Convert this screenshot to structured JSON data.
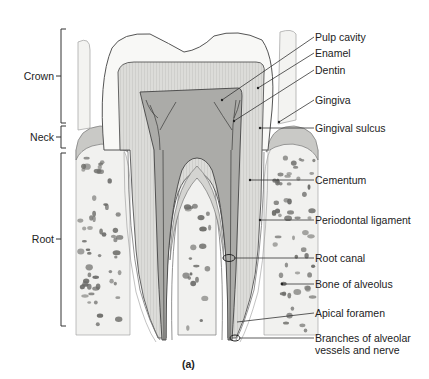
{
  "figure": {
    "caption": "(a)",
    "regions": [
      {
        "id": "crown",
        "label": "Crown"
      },
      {
        "id": "neck",
        "label": "Neck"
      },
      {
        "id": "root",
        "label": "Root"
      }
    ],
    "structures": [
      {
        "id": "pulp-cavity",
        "label": "Pulp cavity"
      },
      {
        "id": "enamel",
        "label": "Enamel"
      },
      {
        "id": "dentin",
        "label": "Dentin"
      },
      {
        "id": "gingiva",
        "label": "Gingiva"
      },
      {
        "id": "gingival-sulcus",
        "label": "Gingival sulcus"
      },
      {
        "id": "cementum",
        "label": "Cementum"
      },
      {
        "id": "periodontal-ligament",
        "label": "Periodontal ligament"
      },
      {
        "id": "root-canal",
        "label": "Root canal"
      },
      {
        "id": "bone-of-alveolus",
        "label": "Bone of alveolus"
      },
      {
        "id": "apical-foramen",
        "label": "Apical foramen"
      },
      {
        "id": "alveolar-vessels",
        "label": "Branches of alveolar\nvessels and nerve",
        "line1": "Branches of alveolar",
        "line2": "vessels and nerve"
      }
    ],
    "colors": {
      "enamel": "#f7f7f5",
      "dentin": "#d9d9d6",
      "pulp": "#a9a9a6",
      "bone": "#f0f0ee",
      "bone_pore": "#6b6b68",
      "line": "#333333",
      "gingiva": "#c9c9c6"
    }
  }
}
